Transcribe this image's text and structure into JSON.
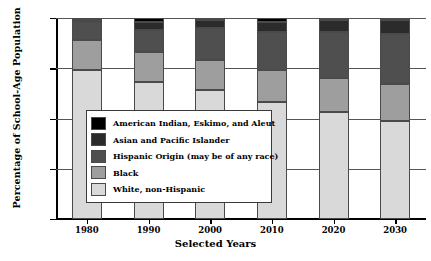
{
  "chart_data": {
    "type": "bar",
    "subtype": "stacked-percentage",
    "title": "",
    "xlabel": "Selected Years",
    "ylabel": "Percentage of School-Age Population",
    "categories": [
      "1980",
      "1990",
      "2000",
      "2010",
      "2020",
      "2030"
    ],
    "ylim": [
      0,
      100
    ],
    "yticks": [
      0,
      25,
      50,
      75,
      100
    ],
    "ytick_labels": [
      "0",
      "25",
      "50",
      "75",
      "100"
    ],
    "grid": true,
    "grid_axis": "y",
    "legend_position": "center-left-inside",
    "stack_order_bottom_to_top": [
      "White, non-Hispanic",
      "Black",
      "Hispanic Origin (may be of any race)",
      "Asian and Pacific Islander",
      "American Indian, Eskimo, and Aleut"
    ],
    "series": [
      {
        "name": "White, non-Hispanic",
        "color": "#d9d9d9",
        "values": [
          74,
          68,
          64,
          58,
          53,
          49
        ]
      },
      {
        "name": "Black",
        "color": "#9e9e9e",
        "values": [
          15,
          15,
          15,
          16,
          17,
          18
        ]
      },
      {
        "name": "Hispanic Origin (may be of any race)",
        "color": "#4f4f4f",
        "values": [
          9,
          11,
          16,
          19,
          23,
          25
        ]
      },
      {
        "name": "Asian and Pacific Islander",
        "color": "#2b2b2b",
        "values": [
          1,
          4,
          4,
          5,
          6,
          7
        ]
      },
      {
        "name": "American Indian, Eskimo, and Aleut",
        "color": "#000000",
        "values": [
          1,
          2,
          1,
          2,
          1,
          1
        ]
      }
    ]
  },
  "legend": {
    "items": [
      {
        "label": "American Indian, Eskimo, and Aleut",
        "color": "#000000"
      },
      {
        "label": "Asian and Pacific Islander",
        "color": "#2b2b2b"
      },
      {
        "label": "Hispanic Origin (may be of any race)",
        "color": "#4f4f4f"
      },
      {
        "label": "Black",
        "color": "#9e9e9e"
      },
      {
        "label": "White, non-Hispanic",
        "color": "#d9d9d9"
      }
    ]
  },
  "axes": {
    "y_title": "Percentage of School-Age Population",
    "x_title": "Selected Years"
  }
}
